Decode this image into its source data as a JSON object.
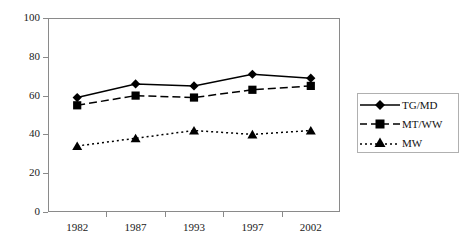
{
  "chart_data": {
    "type": "line",
    "title": "",
    "xlabel": "",
    "ylabel": "",
    "categories": [
      "1982",
      "1987",
      "1993",
      "1997",
      "2002"
    ],
    "ylim": [
      0,
      100
    ],
    "yticks": [
      0,
      20,
      40,
      60,
      80,
      100
    ],
    "grid": false,
    "legend_position": "right",
    "series": [
      {
        "name": "TG/MD",
        "marker": "diamond",
        "line_style": "solid",
        "color": "#000000",
        "values": [
          59,
          66,
          65,
          71,
          69
        ]
      },
      {
        "name": "MT/WW",
        "marker": "square",
        "line_style": "dashed",
        "color": "#000000",
        "values": [
          55,
          60,
          59,
          63,
          65
        ]
      },
      {
        "name": "MW",
        "marker": "triangle",
        "line_style": "dotted",
        "color": "#000000",
        "values": [
          34,
          38,
          42,
          40,
          42
        ]
      }
    ]
  },
  "axes": {
    "y_tick_labels": [
      "100",
      "80",
      "60",
      "40",
      "20",
      "0"
    ],
    "x_tick_labels": [
      "1982",
      "1987",
      "1993",
      "1997",
      "2002"
    ]
  },
  "legend": {
    "entries": [
      {
        "label": "TG/MD"
      },
      {
        "label": "MT/WW"
      },
      {
        "label": "MW"
      }
    ]
  },
  "colors": {
    "axis": "#8a8a8a",
    "series": "#000000",
    "text": "#1a1a1a",
    "legend_border": "#b0b0b0",
    "background": "#ffffff"
  }
}
